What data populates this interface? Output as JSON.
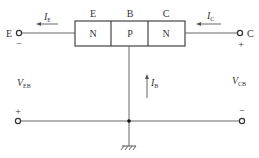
{
  "diagram": {
    "regions": [
      {
        "header": "E",
        "type": "N"
      },
      {
        "header": "B",
        "type": "P"
      },
      {
        "header": "C",
        "type": "N"
      }
    ],
    "terminals": {
      "emitter": {
        "label": "E",
        "polarity": "−"
      },
      "collector": {
        "label": "C",
        "polarity": "+"
      },
      "bottom_left_polarity": "+",
      "bottom_right_polarity": "−"
    },
    "currents": {
      "ie": {
        "main": "I",
        "sub": "E"
      },
      "ic": {
        "main": "I",
        "sub": "C"
      },
      "ib": {
        "main": "I",
        "sub": "B"
      }
    },
    "voltages": {
      "veb": {
        "main": "V",
        "sub": "EB"
      },
      "vcb": {
        "main": "V",
        "sub": "CB"
      }
    },
    "colors": {
      "line": "#555555",
      "text": "#333333",
      "box_fill": "#ffffff"
    }
  }
}
